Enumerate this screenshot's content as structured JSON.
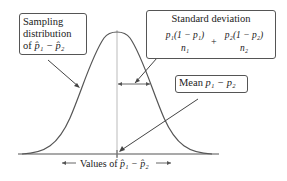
{
  "diagram": {
    "type": "normal-curve-annotation",
    "sampling_label_line1": "Sampling",
    "sampling_label_line2": "distribution",
    "sampling_label_line3_prefix": "of ",
    "sampling_label_line3_math": "p̂₁ − p̂₂",
    "sd_title": "Standard deviation",
    "sd_frac1_num": "p₁(1 − p₁)",
    "sd_frac1_den": "n₁",
    "sd_plus": "+",
    "sd_frac2_num": "p₂(1 − p₂)",
    "sd_frac2_den": "n₂",
    "mean_label": "Mean",
    "mean_math": "p₁ − p₂",
    "x_axis_label_prefix": "Values of",
    "x_axis_label_math": "p̂₁ − p̂₂",
    "colors": {
      "curve": "#555555",
      "axis": "#555555",
      "center_line": "#bbbbbb",
      "box_border": "#555555"
    }
  }
}
